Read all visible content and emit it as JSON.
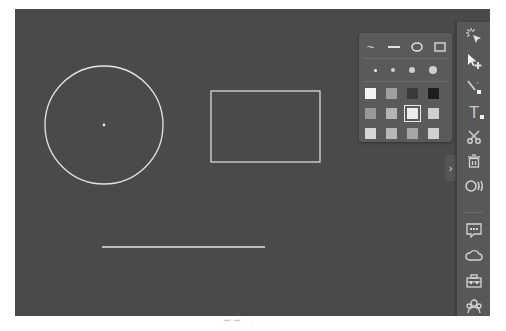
{
  "canvas": {
    "background": "#4a4a4a",
    "stroke_color": "#e4e4e4",
    "shapes": [
      {
        "type": "circle",
        "cx": 89,
        "cy": 116,
        "r": 59,
        "center_dot": true
      },
      {
        "type": "rect",
        "x": 196,
        "y": 82,
        "width": 109,
        "height": 71
      },
      {
        "type": "line",
        "x1": 87,
        "y1": 238,
        "x2": 250,
        "y2": 238
      }
    ]
  },
  "draw_panel": {
    "shape_tools": [
      {
        "name": "freehand",
        "icon": "tilde-icon",
        "glyph": "~"
      },
      {
        "name": "line",
        "icon": "line-icon"
      },
      {
        "name": "ellipse",
        "icon": "ellipse-icon"
      },
      {
        "name": "rectangle",
        "icon": "rectangle-icon"
      }
    ],
    "stroke_sizes": [
      3,
      4,
      6,
      8
    ],
    "colors": [
      [
        "#f4f4f4",
        "#a0a0a0",
        "#3a3a3a",
        "#1e1e1e"
      ],
      [
        "#9a9a9a",
        "#b4b4b4",
        "#ededed",
        "#cfcfcf"
      ],
      [
        "#d6d6d6",
        "#b8b8b8",
        "#a6a6a6",
        "#d0d0d0"
      ]
    ],
    "selected_color_index": [
      1,
      2
    ]
  },
  "panel_toggle": {
    "glyph": "›"
  },
  "sidebar": {
    "items": [
      {
        "name": "laser-pointer",
        "icon": "laser-pointer-icon"
      },
      {
        "name": "select-move",
        "icon": "select-move-icon"
      },
      {
        "name": "draw",
        "icon": "pen-icon"
      },
      {
        "name": "text",
        "icon": "text-icon",
        "glyph": "T"
      },
      {
        "name": "cut",
        "icon": "scissors-icon"
      },
      {
        "name": "delete",
        "icon": "trash-icon"
      },
      {
        "name": "audio",
        "icon": "audio-icon"
      },
      {
        "name": "chat",
        "icon": "chat-icon"
      },
      {
        "name": "cloud",
        "icon": "cloud-icon"
      },
      {
        "name": "toolbox",
        "icon": "toolbox-icon"
      },
      {
        "name": "participants",
        "icon": "participants-icon"
      }
    ]
  },
  "caption": {
    "text": "▔▔ · ·  ·"
  }
}
